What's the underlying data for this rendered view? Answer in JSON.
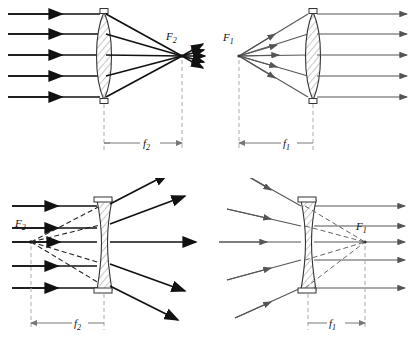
{
  "figure": {
    "stroke_color": "#111111",
    "thin_color": "#555555",
    "dashed_color": "#999999",
    "lens_fill": "#d9d9d9",
    "background": "#ffffff"
  },
  "panels": [
    {
      "id": "top-left",
      "lens_type": "biconvex",
      "description": "Parallel rays entering a converging lens meet at the second focal point F2",
      "focal_label": "F2",
      "focal_label_main": "F",
      "focal_label_sub": "2",
      "distance_label_main": "f",
      "distance_label_sub": "2",
      "ray_count": 5,
      "ray_direction": "left-to-right",
      "focus_side": "right",
      "focus_kind": "real"
    },
    {
      "id": "top-right",
      "lens_type": "biconvex",
      "description": "Rays from the first focal point F1 leave a converging lens parallel",
      "focal_label": "F1",
      "focal_label_main": "F",
      "focal_label_sub": "1",
      "distance_label_main": "f",
      "distance_label_sub": "1",
      "ray_count": 5,
      "ray_direction": "left-to-right",
      "focus_side": "left",
      "focus_kind": "real"
    },
    {
      "id": "bottom-left",
      "lens_type": "biconcave",
      "description": "Parallel rays entering a diverging lens spread out as if from the virtual focal point F2",
      "focal_label": "F2",
      "focal_label_main": "F",
      "focal_label_sub": "2",
      "distance_label_main": "f",
      "distance_label_sub": "2",
      "ray_count": 5,
      "ray_direction": "left-to-right",
      "focus_side": "left",
      "focus_kind": "virtual"
    },
    {
      "id": "bottom-right",
      "lens_type": "biconcave",
      "description": "Rays converging toward the virtual focal point F1 leave a diverging lens parallel",
      "focal_label": "F1",
      "focal_label_main": "F",
      "focal_label_sub": "1",
      "distance_label_main": "f",
      "distance_label_sub": "1",
      "ray_count": 5,
      "ray_direction": "left-to-right",
      "focus_side": "right",
      "focus_kind": "virtual"
    }
  ]
}
